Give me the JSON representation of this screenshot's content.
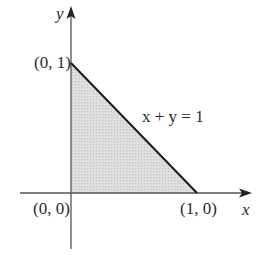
{
  "diagram": {
    "type": "shaded-region-plot",
    "region": "triangle bounded by x-axis, y-axis, and line x + y = 1",
    "colors": {
      "axis": "#555555",
      "boundary_line": "#1a1a1a",
      "shading": "#d9d9d9",
      "text": "#2a2a2a"
    },
    "axes": {
      "x_label": "x",
      "y_label": "y"
    },
    "points": [
      {
        "label": "(0, 1)",
        "x": 0,
        "y": 1
      },
      {
        "label": "(0, 0)",
        "x": 0,
        "y": 0
      },
      {
        "label": "(1, 0)",
        "x": 1,
        "y": 0
      }
    ],
    "line": {
      "equation": "x + y = 1"
    }
  }
}
